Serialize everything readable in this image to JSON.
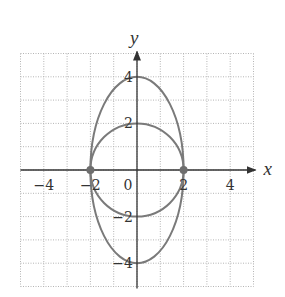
{
  "chart_data": {
    "type": "line",
    "title": "",
    "xlabel": "x",
    "ylabel": "y",
    "xlim": [
      -5,
      5
    ],
    "ylim": [
      -5,
      5
    ],
    "grid": true,
    "grid_style": "dotted",
    "x_ticks": [
      {
        "value": -4,
        "label": "−4"
      },
      {
        "value": -2,
        "label": "−2"
      },
      {
        "value": 0,
        "label": "0"
      },
      {
        "value": 2,
        "label": "2"
      },
      {
        "value": 4,
        "label": "4"
      }
    ],
    "y_ticks": [
      {
        "value": 4,
        "label": "4"
      },
      {
        "value": 2,
        "label": "2"
      },
      {
        "value": -2,
        "label": "−2"
      },
      {
        "value": -4,
        "label": "−4"
      }
    ],
    "series": [
      {
        "name": "ellipse",
        "shape": "ellipse",
        "center": [
          0,
          0
        ],
        "rx": 2,
        "ry": 4,
        "equation": "x^2/4 + y^2/16 = 1"
      },
      {
        "name": "circle",
        "shape": "ellipse",
        "center": [
          0,
          0
        ],
        "rx": 2,
        "ry": 2,
        "equation": "x^2 + y^2 = 4"
      }
    ],
    "points": [
      {
        "x": -2,
        "y": 0
      },
      {
        "x": 2,
        "y": 0
      }
    ],
    "colors": {
      "curve": "#7a7a7a",
      "point": "#6e6e6e",
      "axis": "#333333",
      "grid": "#b5b5b5"
    }
  }
}
